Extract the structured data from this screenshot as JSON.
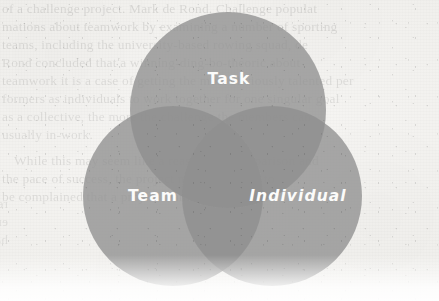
{
  "page": {
    "kind": "scanned-book-page-with-venn-diagram",
    "paper_color": "#f4f3f1",
    "width": 439,
    "height": 301
  },
  "diagram": {
    "type": "venn-3-circle",
    "circle_fill": "#8f8f8f",
    "circle_fill_opacity": 0.78,
    "single_overlap_color": "#949494",
    "double_overlap_color": "#6e6e6e",
    "triple_overlap_color": "#3c3c3c",
    "label_color": "#fbfbfa",
    "circles": [
      {
        "id": "task",
        "label": "Task",
        "cx": 228,
        "cy": 110,
        "r": 98,
        "label_x": 229,
        "label_y": 79,
        "slanted": false
      },
      {
        "id": "team",
        "label": "Team",
        "cx": 173,
        "cy": 196,
        "r": 90,
        "label_x": 153,
        "label_y": 196,
        "slanted": false
      },
      {
        "id": "individual",
        "label": "Individual",
        "cx": 272,
        "cy": 196,
        "r": 90,
        "label_x": 298,
        "label_y": 196,
        "slanted": true
      }
    ]
  },
  "bleed_text": {
    "note": "faint show-through text from the opposite side of the scanned page",
    "lines": [
      {
        "text": "of a challenge project. Mark de Rond. Challenge populat",
        "x": 2,
        "y": 1,
        "mirror": false,
        "opacity": 0.1
      },
      {
        "text": "mations about teamwork by examining a number of sporting",
        "x": 2,
        "y": 19,
        "mirror": false,
        "opacity": 0.1
      },
      {
        "text": "teams, including the university-based rowing squad, de",
        "x": 2,
        "y": 37,
        "mirror": false,
        "opacity": 0.095
      },
      {
        "text": "Rond concluded that a winning-ding-bo-theoric about",
        "x": 2,
        "y": 55,
        "mirror": false,
        "opacity": 0.09
      },
      {
        "text": "teamwork it is a case of getting the most obviously talented per",
        "x": 2,
        "y": 73,
        "mirror": false,
        "opacity": 0.09
      },
      {
        "text": "formers as individuals to work together for one singular goal",
        "x": 2,
        "y": 91,
        "mirror": false,
        "opacity": 0.09
      },
      {
        "text": "as a collective, the more the challenge the members can",
        "x": 2,
        "y": 109,
        "mirror": false,
        "opacity": 0.085
      },
      {
        "text": "usually in-work.",
        "x": 2,
        "y": 127,
        "mirror": false,
        "opacity": 0.085
      },
      {
        "text": "While this may seem like a reasonable comparison and",
        "x": 14,
        "y": 153,
        "mirror": false,
        "opacity": 0.095
      },
      {
        "text": "the pace of success, the project manager needs to",
        "x": 2,
        "y": 171,
        "mirror": false,
        "opacity": 0.095
      },
      {
        "text": "be complained that a project team that has very",
        "x": 2,
        "y": 189,
        "mirror": false,
        "opacity": 0.09
      },
      {
        "text": "reason and",
        "x": 8,
        "y": 196,
        "mirror": true,
        "opacity": 0.075
      },
      {
        "text": "er needs to",
        "x": 8,
        "y": 214,
        "mirror": true,
        "opacity": 0.075
      },
      {
        "text": "had has very",
        "x": 8,
        "y": 232,
        "mirror": true,
        "opacity": 0.07
      }
    ]
  }
}
